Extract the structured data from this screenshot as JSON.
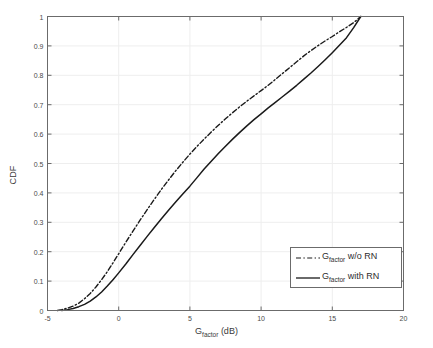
{
  "chart_data": {
    "type": "line",
    "title": "",
    "xlabel": "G_factor (dB)",
    "xlabel_base": "G",
    "xlabel_sub": "factor",
    "xlabel_unit": " (dB)",
    "ylabel": "CDF",
    "xlim": [
      -5,
      20
    ],
    "ylim": [
      0,
      1
    ],
    "xticks": [
      -5,
      0,
      5,
      10,
      15,
      20
    ],
    "xtick_labels": [
      "-5",
      "0",
      "5",
      "10",
      "15",
      "20"
    ],
    "yticks": [
      0,
      0.1,
      0.2,
      0.3,
      0.4,
      0.5,
      0.6,
      0.7,
      0.8,
      0.9,
      1
    ],
    "ytick_labels": [
      "0",
      "0.1",
      "0.2",
      "0.3",
      "0.4",
      "0.5",
      "0.6",
      "0.7",
      "0.8",
      "0.9",
      "1"
    ],
    "grid": true,
    "grid_color": "#eeeeee",
    "axis_color": "#6b6b6b",
    "legend_position": "lower right",
    "series": [
      {
        "name": "G_factor w/o RN",
        "label_base": "G",
        "label_sub": "factor",
        "label_rest": " w/o RN",
        "linestyle": "dashdot",
        "color": "#1a1a1a",
        "x": [
          -4.3,
          -4.0,
          -3.6,
          -3.2,
          -2.8,
          -2.4,
          -2.0,
          -1.6,
          -1.2,
          -0.8,
          -0.4,
          0.0,
          0.5,
          1.0,
          1.5,
          2.0,
          2.5,
          3.0,
          3.5,
          4.0,
          4.5,
          5.0,
          5.5,
          6.0,
          6.5,
          7.0,
          7.5,
          8.0,
          8.5,
          9.0,
          9.5,
          10.0,
          10.5,
          11.0,
          11.5,
          12.0,
          12.5,
          13.0,
          13.5,
          14.0,
          14.5,
          15.0,
          15.5,
          16.0,
          16.5,
          17.0
        ],
        "y": [
          0.0,
          0.003,
          0.008,
          0.015,
          0.025,
          0.04,
          0.058,
          0.08,
          0.105,
          0.132,
          0.162,
          0.193,
          0.232,
          0.27,
          0.307,
          0.343,
          0.378,
          0.412,
          0.444,
          0.475,
          0.504,
          0.532,
          0.558,
          0.583,
          0.607,
          0.63,
          0.652,
          0.673,
          0.693,
          0.712,
          0.73,
          0.748,
          0.766,
          0.786,
          0.806,
          0.826,
          0.846,
          0.866,
          0.884,
          0.901,
          0.917,
          0.932,
          0.948,
          0.963,
          0.979,
          1.0
        ]
      },
      {
        "name": "G_factor with RN",
        "label_base": "G",
        "label_sub": "factor",
        "label_rest": " with RN",
        "linestyle": "solid",
        "color": "#1a1a1a",
        "x": [
          -4.0,
          -3.6,
          -3.2,
          -2.8,
          -2.4,
          -2.0,
          -1.6,
          -1.2,
          -0.8,
          -0.4,
          0.0,
          0.5,
          1.0,
          1.5,
          2.0,
          2.5,
          3.0,
          3.5,
          4.0,
          4.5,
          5.0,
          5.5,
          6.0,
          6.5,
          7.0,
          7.5,
          8.0,
          8.5,
          9.0,
          9.5,
          10.0,
          10.5,
          11.0,
          11.5,
          12.0,
          12.5,
          13.0,
          13.5,
          14.0,
          14.5,
          15.0,
          15.5,
          16.0,
          16.5,
          17.0
        ],
        "y": [
          0.0,
          0.003,
          0.007,
          0.013,
          0.021,
          0.032,
          0.046,
          0.063,
          0.083,
          0.105,
          0.128,
          0.158,
          0.19,
          0.221,
          0.252,
          0.282,
          0.312,
          0.341,
          0.369,
          0.396,
          0.423,
          0.452,
          0.481,
          0.508,
          0.534,
          0.559,
          0.583,
          0.606,
          0.628,
          0.649,
          0.669,
          0.689,
          0.708,
          0.727,
          0.746,
          0.766,
          0.787,
          0.808,
          0.83,
          0.853,
          0.877,
          0.902,
          0.928,
          0.962,
          1.0
        ]
      }
    ]
  }
}
